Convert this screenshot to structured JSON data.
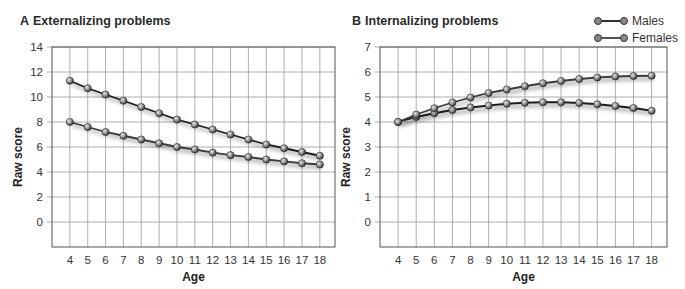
{
  "panels": [
    {
      "letter": "A",
      "title": "Externalizing problems"
    },
    {
      "letter": "B",
      "title": "Internalizing problems"
    }
  ],
  "legend": {
    "items": [
      {
        "label": "Males"
      },
      {
        "label": "Females"
      }
    ]
  },
  "axes": {
    "xlabel": "Age",
    "ylabel": "Raw score"
  },
  "chart_data": [
    {
      "type": "line",
      "title": "A Externalizing problems",
      "xlabel": "Age",
      "ylabel": "Raw score",
      "x": [
        4,
        5,
        6,
        7,
        8,
        9,
        10,
        11,
        12,
        13,
        14,
        15,
        16,
        17,
        18
      ],
      "ylim": [
        -2,
        14
      ],
      "yticks": [
        0,
        2,
        4,
        6,
        8,
        10,
        12,
        14
      ],
      "grid": true,
      "legend_position": "top-right",
      "series": [
        {
          "name": "Males",
          "values": [
            11.3,
            10.7,
            10.2,
            9.7,
            9.2,
            8.7,
            8.2,
            7.8,
            7.4,
            7.0,
            6.6,
            6.2,
            5.9,
            5.6,
            5.3
          ]
        },
        {
          "name": "Females",
          "values": [
            8.0,
            7.6,
            7.2,
            6.9,
            6.6,
            6.3,
            6.0,
            5.8,
            5.55,
            5.35,
            5.2,
            5.0,
            4.85,
            4.7,
            4.6
          ]
        }
      ]
    },
    {
      "type": "line",
      "title": "B Internalizing problems",
      "xlabel": "Age",
      "ylabel": "Raw score",
      "x": [
        4,
        5,
        6,
        7,
        8,
        9,
        10,
        11,
        12,
        13,
        14,
        15,
        16,
        17,
        18
      ],
      "ylim": [
        -1,
        7
      ],
      "yticks": [
        0,
        1,
        2,
        3,
        4,
        5,
        6,
        7
      ],
      "grid": true,
      "legend_position": "top-right",
      "series": [
        {
          "name": "Males",
          "values": [
            4.0,
            4.2,
            4.35,
            4.48,
            4.58,
            4.66,
            4.73,
            4.77,
            4.79,
            4.79,
            4.76,
            4.71,
            4.64,
            4.56,
            4.45
          ]
        },
        {
          "name": "Females",
          "values": [
            4.0,
            4.3,
            4.55,
            4.78,
            4.98,
            5.16,
            5.3,
            5.43,
            5.55,
            5.64,
            5.72,
            5.78,
            5.82,
            5.84,
            5.85
          ]
        }
      ]
    }
  ]
}
